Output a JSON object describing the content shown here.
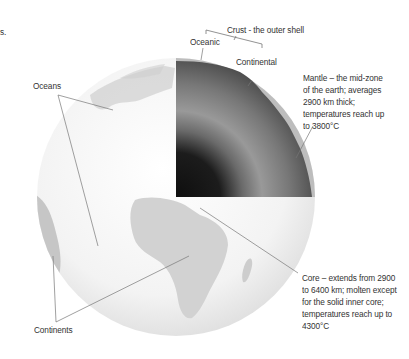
{
  "fragment": {
    "text": "s."
  },
  "labels": {
    "crust": "Crust - the outer shell",
    "oceanic": "Oceanic",
    "continental": "Continental",
    "oceans": "Oceans",
    "continents": "Continents",
    "mantle": {
      "lines": [
        "Mantle – the mid-zone",
        "of the earth; averages",
        "2900 km thick;",
        "temperatures reach up",
        "to 3800°C"
      ]
    },
    "core": {
      "lines": [
        "Core – extends from 2900",
        "to 6400 km; molten except",
        "for the solid inner core;",
        "temperatures reach up to",
        "4300°C"
      ]
    }
  },
  "colors": {
    "globe_light": "#f4f4f4",
    "land": "#c9c9c9",
    "crust": "#bdbdbd",
    "mantle_outer": "#5a5a5a",
    "mantle_mid": "#8e8e8e",
    "core": "#141414",
    "leader_line": "#777777"
  }
}
